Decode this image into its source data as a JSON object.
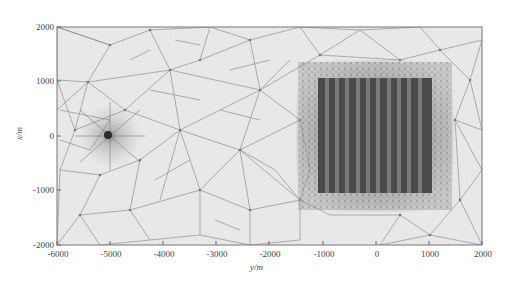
{
  "figure": {
    "type": "triangular-mesh",
    "xlabel": "y/m",
    "ylabel": "x/m",
    "x_ticks": [
      "-6000",
      "-5000",
      "-4000",
      "-3000",
      "-2000",
      "-1000",
      "0",
      "1000",
      "2000"
    ],
    "y_ticks": [
      "2000",
      "1000",
      "0",
      "-1000",
      "-2000"
    ],
    "x_range": [
      -6000,
      2000
    ],
    "y_range": [
      -2000,
      2000
    ],
    "refined_point": {
      "y": -5000,
      "x": 0
    },
    "refined_block": {
      "y_min": -1100,
      "y_max": 1100,
      "x_min": -1050,
      "x_max": 1050,
      "stripes": 11
    },
    "colors": {
      "background": "#e6e6e6",
      "mesh_line": "#8c8c8c",
      "dense": "#333333"
    }
  }
}
